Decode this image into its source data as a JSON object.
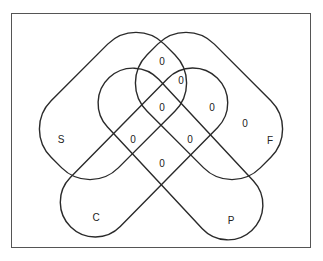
{
  "diagram": {
    "type": "venn",
    "set_count": 4,
    "colors": {
      "outline": "#2a2a2a",
      "frame": "#555555",
      "background": "#ffffff"
    },
    "sets": [
      {
        "id": "S",
        "label": "S"
      },
      {
        "id": "F",
        "label": "F"
      },
      {
        "id": "C",
        "label": "C"
      },
      {
        "id": "P",
        "label": "P"
      }
    ],
    "region_values": [
      {
        "id": "r1",
        "value": "0"
      },
      {
        "id": "r2",
        "value": "0"
      },
      {
        "id": "r3",
        "value": "0"
      },
      {
        "id": "r4",
        "value": "0"
      },
      {
        "id": "r5",
        "value": "0"
      },
      {
        "id": "r6",
        "value": "0"
      },
      {
        "id": "r7",
        "value": "0"
      },
      {
        "id": "r8",
        "value": "0"
      }
    ]
  }
}
